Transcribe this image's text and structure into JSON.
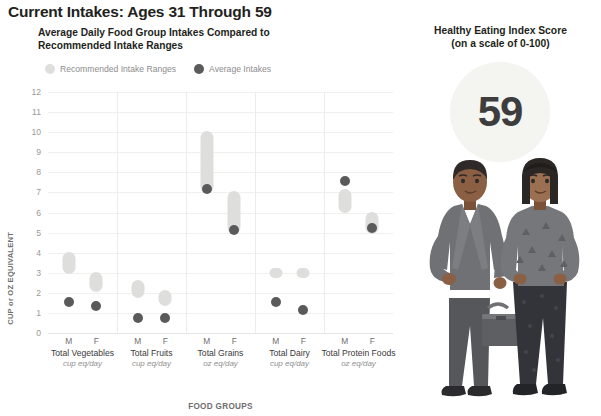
{
  "header": {
    "title": "Current Intakes: Ages 31 Through 59",
    "chart_subtitle": "Average Daily Food Group Intakes Compared to Recommended Intake Ranges"
  },
  "legend": {
    "items": [
      {
        "label": "Recommended Intake Ranges",
        "color": "#dededd",
        "icon": "circle-swatch-icon"
      },
      {
        "label": "Average Intakes",
        "color": "#5b5b5b",
        "icon": "circle-swatch-icon"
      }
    ]
  },
  "hei": {
    "title": "Healthy Eating Index Score",
    "subtitle": "(on a scale of 0-100)",
    "score": "59",
    "circle_color": "#f4f4f1"
  },
  "illustration": {
    "name": "two-adults-illustration",
    "figures": [
      "man-with-briefcase",
      "woman-standing"
    ]
  },
  "chart_data": {
    "type": "scatter",
    "title": "Average Daily Food Group Intakes Compared to Recommended Intake Ranges",
    "xlabel": "FOOD GROUPS",
    "ylabel": "CUP or OZ EQUIVALENT",
    "ylim": [
      0,
      12
    ],
    "yticks": [
      0,
      1,
      2,
      3,
      4,
      5,
      6,
      7,
      8,
      9,
      10,
      11,
      12
    ],
    "grid": true,
    "legend_position": "top",
    "groups": [
      {
        "name": "Total Vegetables",
        "unit": "cup eq/day",
        "series": [
          {
            "sex": "M",
            "recommended_range": [
              3.2,
              3.8
            ],
            "average_intake": 1.8
          },
          {
            "sex": "F",
            "recommended_range": [
              2.3,
              2.8
            ],
            "average_intake": 1.6
          }
        ]
      },
      {
        "name": "Total Fruits",
        "unit": "cup eq/day",
        "series": [
          {
            "sex": "M",
            "recommended_range": [
              2.0,
              2.4
            ],
            "average_intake": 1.0
          },
          {
            "sex": "F",
            "recommended_range": [
              1.6,
              1.9
            ],
            "average_intake": 1.0
          }
        ]
      },
      {
        "name": "Total Grains",
        "unit": "oz eq/day",
        "series": [
          {
            "sex": "M",
            "recommended_range": [
              7.2,
              9.8
            ],
            "average_intake": 7.4
          },
          {
            "sex": "F",
            "recommended_range": [
              5.2,
              6.8
            ],
            "average_intake": 5.4
          }
        ]
      },
      {
        "name": "Total Dairy",
        "unit": "cup eq/day",
        "series": [
          {
            "sex": "M",
            "recommended_range": [
              3.0,
              3.0
            ],
            "average_intake": 1.8
          },
          {
            "sex": "F",
            "recommended_range": [
              3.0,
              3.0
            ],
            "average_intake": 1.4
          }
        ]
      },
      {
        "name": "Total Protein Foods",
        "unit": "oz eq/day",
        "series": [
          {
            "sex": "M",
            "recommended_range": [
              6.2,
              6.9
            ],
            "average_intake": 7.8
          },
          {
            "sex": "F",
            "recommended_range": [
              5.2,
              5.8
            ],
            "average_intake": 5.5
          }
        ]
      }
    ]
  }
}
